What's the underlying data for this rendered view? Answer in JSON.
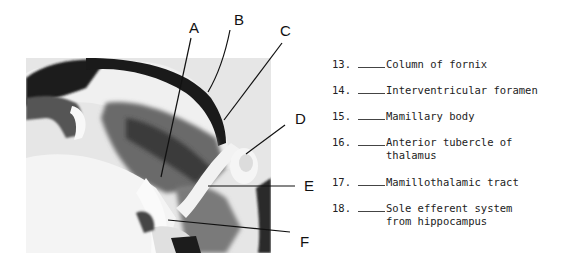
{
  "figure": {
    "labels": [
      "A",
      "B",
      "C",
      "D",
      "E",
      "F"
    ]
  },
  "question_list": {
    "items": [
      {
        "number": "13.",
        "blank": "____",
        "lines": [
          "Column of fornix"
        ]
      },
      {
        "number": "14.",
        "blank": "____",
        "lines": [
          "Interventricular foramen"
        ]
      },
      {
        "number": "15.",
        "blank": "____",
        "lines": [
          "Mamillary body"
        ]
      },
      {
        "number": "16.",
        "blank": "____",
        "lines": [
          "Anterior tubercle of",
          "thalamus"
        ]
      },
      {
        "number": "17.",
        "blank": "____",
        "lines": [
          "Mamillothalamic tract"
        ]
      },
      {
        "number": "18.",
        "blank": "____",
        "lines": [
          "Sole efferent system",
          "from hippocampus"
        ]
      }
    ]
  }
}
